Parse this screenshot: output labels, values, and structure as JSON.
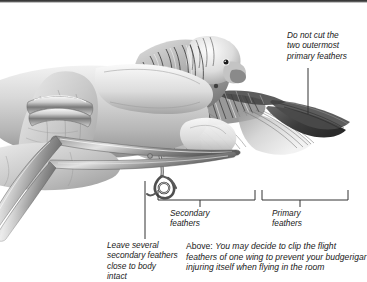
{
  "page": {
    "title": "Wing clipping"
  },
  "annotations": {
    "top_right": "Do not cut the\ntwo outermost\nprimary feathers",
    "bottom_left": "Leave several\nsecondary feathers\nclose to body\nintact",
    "secondary_label": "Secondary\nfeathers",
    "primary_label": "Primary\nfeathers"
  },
  "caption": {
    "lead": "Above: ",
    "body": "You may decide to clip the flight feathers of one wing to prevent your budgerigar injuring itself when flying in the room"
  },
  "illustration": {
    "alt": "Pencil illustration of a hand holding a budgerigar with one wing spread while scissors trim the flight feathers",
    "subjects": [
      "human-hand",
      "ring",
      "budgerigar",
      "spread-wing",
      "scissors",
      "bird-foot"
    ]
  },
  "colors": {
    "background": "#ffffff",
    "text": "#1a1a1a",
    "line": "#3a3a3a",
    "top_band": "#2e2e2e"
  }
}
